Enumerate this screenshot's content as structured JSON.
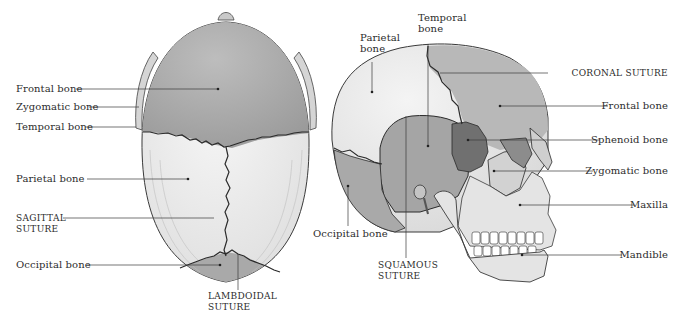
{
  "figure": {
    "colors": {
      "background": "#ffffff",
      "frontal_top_view": "#a6a6a6",
      "parietal": "#ececec",
      "occipital": "#a9a9a9",
      "temporal": "#a3a3a3",
      "sphenoid": "#6e6e6e",
      "zygomatic": "#d0d0d0",
      "face_bone": "#e6e6e6",
      "suture_line": "#2a2a2a",
      "leader_line": "#3a3a3a",
      "label_text": "#2b2b2b"
    },
    "top_view": {
      "name": "superior view of skull",
      "labels": {
        "frontal": "Frontal bone",
        "zygomatic": "Zygomatic bone",
        "temporal": "Temporal bone",
        "parietal": "Parietal bone",
        "sagittal": "SAGITTAL\nSUTURE",
        "occipital": "Occipital bone",
        "lambdoidal": "LAMBDOIDAL\nSUTURE"
      }
    },
    "side_view": {
      "name": "lateral view of skull",
      "labels": {
        "parietal": "Parietal\nbone",
        "temporal": "Temporal\nbone",
        "coronal": "CORONAL SUTURE",
        "frontal": "Frontal bone",
        "sphenoid": "Sphenoid bone",
        "zygomatic": "Zygomatic bone",
        "maxilla": "Maxilla",
        "mandible": "Mandible",
        "occipital": "Occipital bone",
        "squamous": "SQUAMOUS\nSUTURE"
      }
    }
  }
}
